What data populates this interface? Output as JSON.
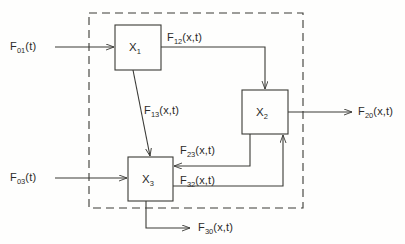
{
  "diagram": {
    "background_color": "#fefefd",
    "line_color": "#3a3a36",
    "boundary": {
      "style": "dashed",
      "name": "system-boundary"
    },
    "blocks": [
      {
        "id": "x1",
        "label_base": "X",
        "label_sub": "1"
      },
      {
        "id": "x2",
        "label_base": "X",
        "label_sub": "2"
      },
      {
        "id": "x3",
        "label_base": "X",
        "label_sub": "3"
      }
    ],
    "flows": [
      {
        "id": "f01",
        "base": "F",
        "sub": "01",
        "args": "(t)"
      },
      {
        "id": "f03",
        "base": "F",
        "sub": "03",
        "args": "(t)"
      },
      {
        "id": "f12",
        "base": "F",
        "sub": "12",
        "args": "(x,t)"
      },
      {
        "id": "f13",
        "base": "F",
        "sub": "13",
        "args": "(x,t)"
      },
      {
        "id": "f20",
        "base": "F",
        "sub": "20",
        "args": "(x,t)"
      },
      {
        "id": "f23",
        "base": "F",
        "sub": "23",
        "args": "(x,t)"
      },
      {
        "id": "f32",
        "base": "F",
        "sub": "32",
        "args": "(x,t)"
      },
      {
        "id": "f30",
        "base": "F",
        "sub": "30",
        "args": "(x,t)"
      }
    ]
  }
}
